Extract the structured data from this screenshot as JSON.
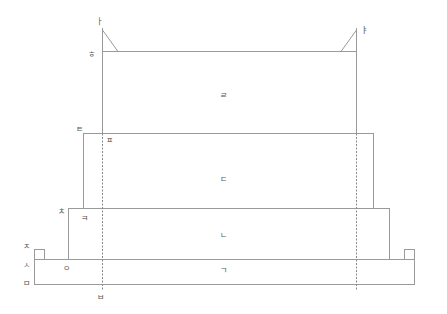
{
  "diagram": {
    "line_color": "#999999",
    "dashed_color": "#888888",
    "labels": {
      "top_left_mark": "ㅏ",
      "top_right_mark": "ㅑ",
      "top_box_corner": "ㅎ",
      "tier4": "ㄹ",
      "tier3_corner": "ㅌ",
      "tier3_inner": "ㅍ",
      "tier3": "ㄷ",
      "tier2_corner": "ㅊ",
      "tier2_inner": "ㅋ",
      "tier2": "ㄴ",
      "base_top_mark": "ㅈ",
      "base_side_mark": "ㅅ",
      "base_inner": "ㅇ",
      "tier1": "ㄱ",
      "base_bottom_mark": "ㅁ",
      "center_bottom_mark": "ㅂ"
    }
  }
}
